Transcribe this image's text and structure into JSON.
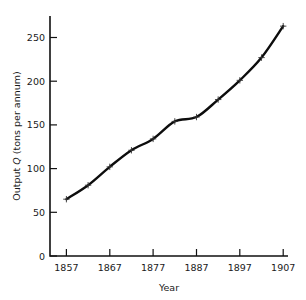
{
  "chart_data": {
    "type": "line",
    "title": "",
    "xlabel": "Year",
    "ylabel": "Output Q (tons per annum)",
    "ylabel_parts": {
      "prefix": "Output ",
      "symbol": "Q",
      "suffix": " (tons per annum)"
    },
    "x": [
      1857,
      1862,
      1867,
      1872,
      1877,
      1882,
      1887,
      1892,
      1897,
      1902,
      1907
    ],
    "values": [
      65,
      81,
      102,
      121,
      134,
      154,
      159,
      179,
      201,
      227,
      263
    ],
    "series": [
      {
        "name": "Output Q",
        "values": [
          65,
          81,
          102,
          121,
          134,
          154,
          159,
          179,
          201,
          227,
          263
        ]
      }
    ],
    "xlim": [
      1855,
      1907.8
    ],
    "ylim": [
      0,
      268
    ],
    "xticks": [
      1857,
      1867,
      1877,
      1887,
      1897,
      1907
    ],
    "xtick_labels": [
      "1857",
      "1867",
      "1877",
      "1887",
      "1897",
      "1907"
    ],
    "yticks": [
      0,
      50,
      100,
      150,
      200,
      250
    ],
    "ytick_labels": [
      "0",
      "50",
      "100",
      "150",
      "200",
      "250"
    ],
    "grid": false,
    "legend": null,
    "marker": "plus",
    "line_color": "#0d0d0d",
    "marker_color": "#333333",
    "background": "#ffffff"
  }
}
